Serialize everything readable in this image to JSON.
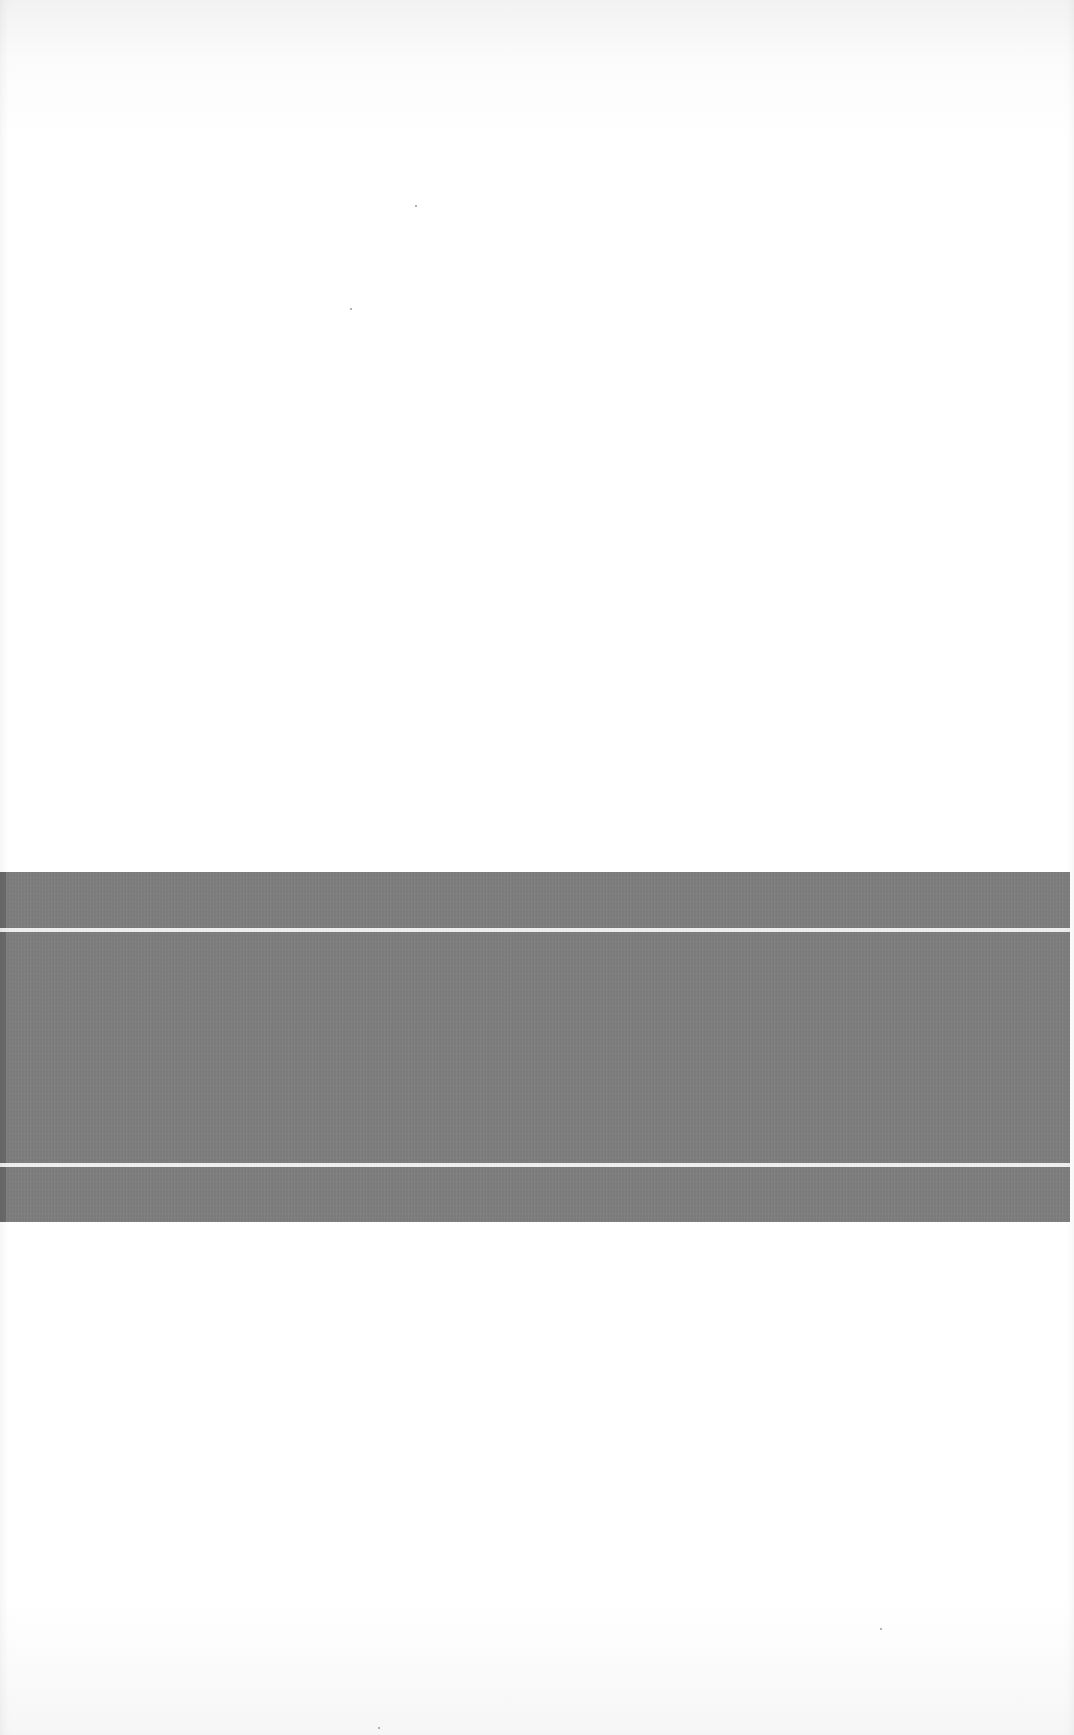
{
  "image": {
    "description": "Blank textured sheet with a horizontal gray band crossed by two thin white lines",
    "colors": {
      "background": "#ffffff",
      "band": "#7d7d7d",
      "band_edge": "#6a6a6a",
      "lines": "#eeeeee"
    },
    "band": {
      "top": 872,
      "bottom": 1222,
      "left": 0,
      "right": 1070
    },
    "lines": [
      {
        "top": 928,
        "height": 4
      },
      {
        "top": 1163,
        "height": 4
      }
    ],
    "text": []
  }
}
